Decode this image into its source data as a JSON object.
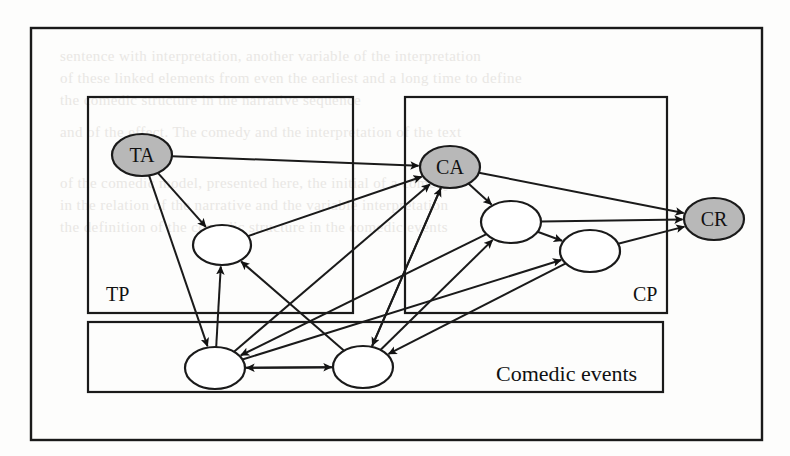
{
  "figure": {
    "type": "node-link-diagram",
    "background_color": "#fdfdfc",
    "stroke_color": "#1a1a1a",
    "shaded_node_fill": "#b8b8b8",
    "plain_node_fill": "#ffffff",
    "outer_frame": {
      "x": 31,
      "y": 28,
      "w": 731,
      "h": 412
    }
  },
  "containers": [
    {
      "id": "tp",
      "label": "TP",
      "label_x": 106,
      "label_y": 301,
      "x": 88,
      "y": 97,
      "w": 265,
      "h": 216
    },
    {
      "id": "cp",
      "label": "CP",
      "label_x": 633,
      "label_y": 301,
      "x": 405,
      "y": 97,
      "w": 262,
      "h": 216
    },
    {
      "id": "comedic",
      "label": "Comedic events",
      "label_x": 496,
      "label_y": 381,
      "x": 88,
      "y": 322,
      "w": 575,
      "h": 70
    }
  ],
  "nodes": [
    {
      "id": "TA",
      "label": "TA",
      "cx": 142,
      "cy": 155,
      "rx": 30,
      "ry": 21,
      "shaded": true
    },
    {
      "id": "CA",
      "label": "CA",
      "cx": 450,
      "cy": 167,
      "rx": 30,
      "ry": 21,
      "shaded": true
    },
    {
      "id": "CR",
      "label": "CR",
      "cx": 714,
      "cy": 219,
      "rx": 30,
      "ry": 21,
      "shaded": true
    },
    {
      "id": "tp1",
      "label": "",
      "cx": 222,
      "cy": 245,
      "rx": 29,
      "ry": 20,
      "shaded": false
    },
    {
      "id": "cp1",
      "label": "",
      "cx": 511,
      "cy": 222,
      "rx": 30,
      "ry": 21,
      "shaded": false
    },
    {
      "id": "cp2",
      "label": "",
      "cx": 590,
      "cy": 251,
      "rx": 30,
      "ry": 21,
      "shaded": false
    },
    {
      "id": "ce1",
      "label": "",
      "cx": 215,
      "cy": 368,
      "rx": 30,
      "ry": 21,
      "shaded": false
    },
    {
      "id": "ce2",
      "label": "",
      "cx": 363,
      "cy": 367,
      "rx": 30,
      "ry": 21,
      "shaded": false
    }
  ],
  "edges": [
    {
      "id": "e1",
      "from": "TA",
      "to": "CA",
      "name": "ta-to-ca"
    },
    {
      "id": "e2",
      "from": "TA",
      "to": "tp1",
      "name": "ta-to-tp1"
    },
    {
      "id": "e3",
      "from": "TA",
      "to": "ce1",
      "name": "ta-to-ce1"
    },
    {
      "id": "e4",
      "from": "CA",
      "to": "CR",
      "name": "ca-to-cr"
    },
    {
      "id": "e5",
      "from": "CA",
      "to": "cp1",
      "name": "ca-to-cp1"
    },
    {
      "id": "e6",
      "from": "CA",
      "to": "ce2",
      "name": "ca-to-ce2"
    },
    {
      "id": "e7",
      "from": "tp1",
      "to": "CA",
      "name": "tp1-to-ca"
    },
    {
      "id": "e8",
      "from": "ce1",
      "to": "tp1",
      "name": "ce1-to-tp1"
    },
    {
      "id": "e9",
      "from": "ce1",
      "to": "CA",
      "name": "ce1-to-ca"
    },
    {
      "id": "e10",
      "from": "ce2",
      "to": "tp1",
      "name": "ce2-to-tp1"
    },
    {
      "id": "e11",
      "from": "ce2",
      "to": "CA",
      "name": "ce2-to-ca"
    },
    {
      "id": "e12",
      "from": "ce2",
      "to": "cp1",
      "name": "ce2-to-cp1"
    },
    {
      "id": "e13",
      "from": "ce1",
      "to": "ce2",
      "name": "ce1-to-ce2"
    },
    {
      "id": "e14",
      "from": "ce2",
      "to": "ce1",
      "name": "ce2-to-ce1"
    },
    {
      "id": "e15",
      "from": "cp1",
      "to": "cp2",
      "name": "cp1-to-cp2"
    },
    {
      "id": "e16",
      "from": "cp1",
      "to": "CR",
      "name": "cp1-to-cr"
    },
    {
      "id": "e17",
      "from": "cp2",
      "to": "CR",
      "name": "cp2-to-cr"
    },
    {
      "id": "e18",
      "from": "cp2",
      "to": "ce2",
      "name": "cp2-to-ce2"
    },
    {
      "id": "e19",
      "from": "ce1",
      "to": "cp2",
      "name": "ce1-to-cp2"
    },
    {
      "id": "e20",
      "from": "cp1",
      "to": "ce1",
      "name": "cp1-to-ce1"
    }
  ],
  "background_text": {
    "lines": [
      {
        "text": "sentence with interpretation, another variable of the interpretation",
        "x": 60,
        "y": 48
      },
      {
        "text": "of these linked elements from even the earliest and a long time to define",
        "x": 60,
        "y": 70
      },
      {
        "text": "the comedic structure in the narrative sequence",
        "x": 60,
        "y": 92
      },
      {
        "text": "and of the effect. The comedy and the interpretation of the text",
        "x": 60,
        "y": 124
      },
      {
        "text": "of the comedic model, presented here, the initial of a comedy",
        "x": 60,
        "y": 175
      },
      {
        "text": "in the relation of the narrative and the variable interpretation",
        "x": 60,
        "y": 197
      },
      {
        "text": "the definition of the comedic structure in the comedic events",
        "x": 60,
        "y": 219
      }
    ]
  }
}
